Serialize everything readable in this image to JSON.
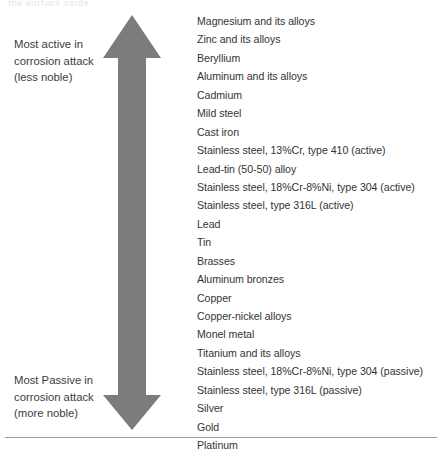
{
  "figure": {
    "name": "galvanic-series-diagram",
    "background_color": "#ffffff",
    "arrow_color": "#7c7c7c",
    "text_color": "#343434",
    "rule_color": "#9a9a9a",
    "top_artifact_text": "the  surface  oxide"
  },
  "labels": {
    "top": {
      "line1": "Most active in",
      "line2": "corrosion attack",
      "line3": "(less noble)"
    },
    "bottom": {
      "line1": "Most Passive in",
      "line2": "corrosion attack",
      "line3": "(more noble)"
    }
  },
  "metals": [
    "Magnesium and its alloys",
    "Zinc and its alloys",
    "Beryllium",
    "Aluminum and its alloys",
    "Cadmium",
    "Mild steel",
    "Cast iron",
    "Stainless steel, 13%Cr, type 410 (active)",
    "Lead-tin (50-50) alloy",
    "Stainless steel, 18%Cr-8%Ni, type 304 (active)",
    "Stainless steel, type 316L (active)",
    "Lead",
    "Tin",
    "Brasses",
    "Aluminum bronzes",
    "Copper",
    "Copper-nickel alloys",
    "Monel metal",
    "Titanium and its alloys",
    "Stainless steel, 18%Cr-8%Ni, type 304 (passive)",
    "Stainless steel, type 316L (passive)",
    "Silver",
    "Gold",
    "Platinum"
  ]
}
